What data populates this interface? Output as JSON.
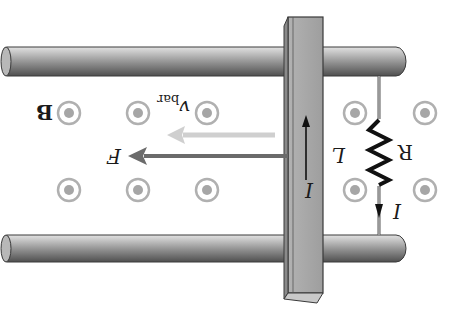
{
  "figure": {
    "orientation_degrees": 180,
    "colors": {
      "rail_dark": "#5a5a5a",
      "rail_light": "#d8d8d8",
      "bar_face": "#a8a8a8",
      "bar_side": "#8a8a8a",
      "field_ring": "#b0b0b0",
      "field_dot": "#a6a6a6",
      "force_arrow": "#6b6b6b",
      "velocity_arrow": "#cfcfcf",
      "resistor": "#111111"
    },
    "labels": {
      "field": "B",
      "velocity_main": "v",
      "velocity_sub": "bar",
      "force": "F",
      "length": "L",
      "resistance": "R",
      "current_bar": "I",
      "current_wire": "I"
    },
    "field_symbol": "out-of-page (dot in circle)",
    "field_rows": 2,
    "field_dots_per_row": 5
  }
}
